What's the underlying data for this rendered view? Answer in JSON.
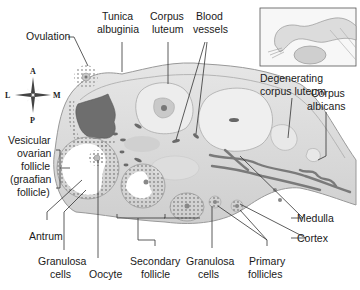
{
  "diagram": {
    "colors": {
      "background": "#ffffff",
      "ovary_fill": "#d6d6d6",
      "ovary_inner": "#e4e4e4",
      "capsule": "#c2c2c2",
      "ruptured_follicle": "#6e6e6e",
      "corpus_luteum": "#ededed",
      "vessels": "#7a7a7a",
      "label_text": "#1a1a1a",
      "leader_lines": "#333333"
    },
    "compass": {
      "top": "A",
      "left": "L",
      "right": "M",
      "bottom": "P"
    },
    "labels": {
      "ovulation": "Ovulation",
      "tunica_1": "Tunica",
      "tunica_2": "albuginia",
      "corpus_luteum_1": "Corpus",
      "corpus_luteum_2": "luteum",
      "blood_vessels_1": "Blood",
      "blood_vessels_2": "vessels",
      "degenerating_1": "Degenerating",
      "degenerating_2": "corpus luteum",
      "corpus_albicans_1": "Corpus",
      "corpus_albicans_2": "albicans",
      "vesicular_1": "Vesicular",
      "vesicular_2": "ovarian",
      "vesicular_3": "follicle",
      "vesicular_4": "(graafian",
      "vesicular_5": "follicle)",
      "antrum": "Antrum",
      "granulosa_left_1": "Granulosa",
      "granulosa_left_2": "cells",
      "oocyte": "Oocyte",
      "secondary_1": "Secondary",
      "secondary_2": "follicle",
      "granulosa_right_1": "Granulosa",
      "granulosa_right_2": "cells",
      "primary_1": "Primary",
      "primary_2": "follicles",
      "medulla": "Medulla",
      "cortex": "Cortex"
    },
    "inset": {
      "description": "Uterine tube and ovary overview"
    }
  }
}
